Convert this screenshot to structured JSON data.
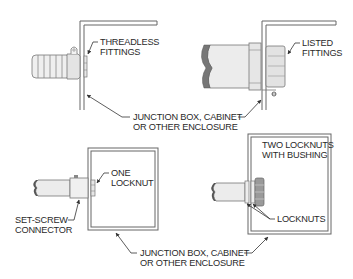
{
  "panels": {
    "threadless": {
      "label_line1": "THREADLESS",
      "label_line2": "FITTINGS"
    },
    "listed": {
      "label_line1": "LISTED",
      "label_line2": "FITTINGS"
    },
    "top_enclosure": {
      "label_line1": "JUNCTION BOX, CABINET",
      "label_line2": "OR OTHER ENCLOSURE"
    },
    "set_screw": {
      "connector_line1": "SET-SCREW",
      "connector_line2": "CONNECTOR",
      "locknut_line1": "ONE",
      "locknut_line2": "LOCKNUT"
    },
    "two_locknuts": {
      "title_line1": "TWO LOCKNUTS",
      "title_line2": "WITH BUSHING",
      "locknuts_label": "LOCKNUTS"
    },
    "bottom_enclosure": {
      "label_line1": "JUNCTION BOX, CABINET",
      "label_line2": "OR OTHER ENCLOSURE"
    }
  },
  "colors": {
    "line": "#555555",
    "fill_light": "#ededed",
    "fill_mid": "#d6d6d6",
    "fill_dark": "#8a8a8a",
    "text": "#2a2a2a"
  }
}
